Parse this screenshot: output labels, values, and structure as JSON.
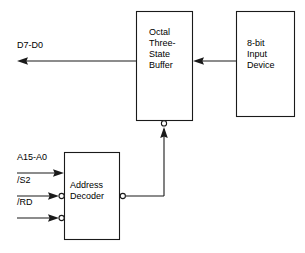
{
  "diagram": {
    "stroke_color": "#1a1a1a",
    "text_color": "#000000",
    "background_color": "#ffffff",
    "blocks": [
      {
        "id": "octal-buffer",
        "lines": [
          "Octal",
          "Three-",
          "State",
          "Buffer"
        ],
        "text": "Octal Three-State Buffer"
      },
      {
        "id": "input-device",
        "lines": [
          "8-bit",
          "Input",
          "Device"
        ],
        "text": "8-bit Input Device"
      },
      {
        "id": "address-decoder",
        "lines": [
          "Address",
          "Decoder"
        ],
        "text": "Address Decoder"
      }
    ],
    "signals": [
      {
        "id": "data-bus",
        "label": "D7-D0"
      },
      {
        "id": "address-bus",
        "label": "A15-A0"
      },
      {
        "id": "chip-select",
        "label": "/S2"
      },
      {
        "id": "read-strobe",
        "label": "/RD"
      }
    ]
  }
}
